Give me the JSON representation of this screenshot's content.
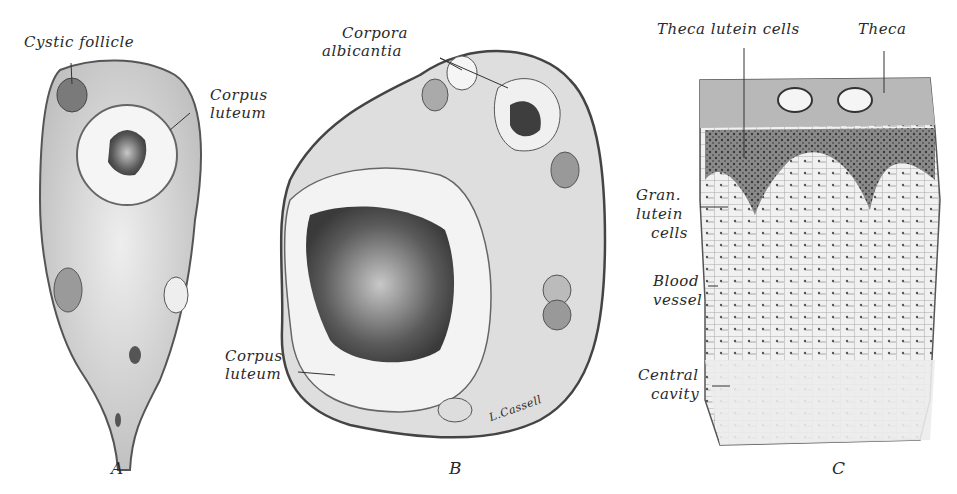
{
  "figure": {
    "panels": [
      {
        "id": "A",
        "letter": "A",
        "labels": [
          "Cystic follicle",
          "Corpus luteum"
        ]
      },
      {
        "id": "B",
        "letter": "B",
        "labels": [
          "Corpora albicantia",
          "Corpus luteum"
        ],
        "signature": "L.Cassell"
      },
      {
        "id": "C",
        "letter": "C",
        "labels": [
          "Theca lutein cells",
          "Theca",
          "Gran. lutein cells",
          "Blood vessel",
          "Central cavity"
        ]
      }
    ],
    "labels": {
      "a_cystic": "Cystic follicle",
      "a_corpus_1": "Corpus",
      "a_corpus_2": "luteum",
      "b_corpora_1": "Corpora",
      "b_corpora_2": "albicantia",
      "b_corpus_1": "Corpus",
      "b_corpus_2": "luteum",
      "b_signature": "L.Cassell",
      "c_theca_lutein": "Theca lutein cells",
      "c_theca": "Theca",
      "c_gran_1": "Gran.",
      "c_gran_2": "lutein",
      "c_gran_3": "cells",
      "c_blood_1": "Blood",
      "c_blood_2": "vessel",
      "c_central_1": "Central",
      "c_central_2": "cavity"
    },
    "letters": {
      "a": "A",
      "b": "B",
      "c": "C"
    }
  }
}
